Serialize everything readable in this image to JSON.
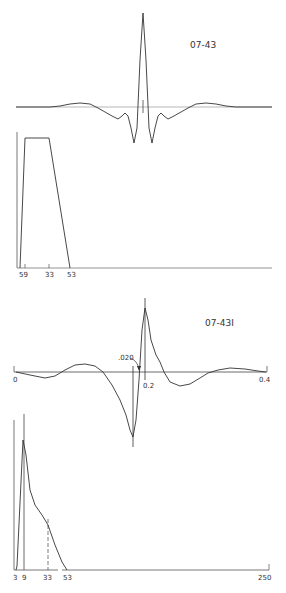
{
  "chart_data": [
    {
      "type": "line",
      "title": "07-43",
      "description": "Zero-phase wavelet (time domain)",
      "xlabel": "",
      "ylabel": "",
      "grid": false,
      "points": [
        [
          16,
          107
        ],
        [
          50,
          107
        ],
        [
          60,
          106
        ],
        [
          70,
          104
        ],
        [
          80,
          103
        ],
        [
          90,
          104
        ],
        [
          98,
          108
        ],
        [
          105,
          112
        ],
        [
          112,
          116
        ],
        [
          118,
          119
        ],
        [
          122,
          116
        ],
        [
          125,
          113
        ],
        [
          128,
          116
        ],
        [
          131,
          128
        ],
        [
          134,
          143
        ],
        [
          137,
          128
        ],
        [
          140,
          60
        ],
        [
          143,
          13
        ],
        [
          146,
          60
        ],
        [
          149,
          128
        ],
        [
          152,
          143
        ],
        [
          155,
          128
        ],
        [
          158,
          116
        ],
        [
          161,
          113
        ],
        [
          164,
          116
        ],
        [
          168,
          119
        ],
        [
          174,
          116
        ],
        [
          181,
          112
        ],
        [
          188,
          108
        ],
        [
          196,
          104
        ],
        [
          206,
          103
        ],
        [
          216,
          104
        ],
        [
          226,
          106
        ],
        [
          236,
          107
        ],
        [
          272,
          107
        ]
      ]
    },
    {
      "type": "line",
      "title": "",
      "description": "Amplitude spectrum for 07-43 (trapezoid)",
      "xtick_labels": [
        "59",
        "33",
        "53"
      ],
      "points": [
        [
          20,
          268
        ],
        [
          25,
          138
        ],
        [
          49,
          138
        ],
        [
          70,
          268
        ]
      ]
    },
    {
      "type": "line",
      "title": "07-43I",
      "description": "Minimum/mixed-phase wavelet (time domain)",
      "xtick_labels": [
        "0",
        "0.2",
        "0.4"
      ],
      "annotations": [
        ".020"
      ],
      "points": [
        [
          16,
          372
        ],
        [
          30,
          375
        ],
        [
          45,
          378
        ],
        [
          55,
          376
        ],
        [
          65,
          370
        ],
        [
          75,
          365
        ],
        [
          85,
          364
        ],
        [
          95,
          366
        ],
        [
          103,
          372
        ],
        [
          112,
          385
        ],
        [
          120,
          400
        ],
        [
          126,
          415
        ],
        [
          130,
          430
        ],
        [
          133,
          437
        ],
        [
          136,
          420
        ],
        [
          139,
          380
        ],
        [
          142,
          330
        ],
        [
          145,
          308
        ],
        [
          148,
          320
        ],
        [
          151,
          340
        ],
        [
          156,
          355
        ],
        [
          160,
          362
        ],
        [
          164,
          372
        ],
        [
          170,
          382
        ],
        [
          180,
          386
        ],
        [
          190,
          384
        ],
        [
          200,
          378
        ],
        [
          208,
          373
        ],
        [
          218,
          370
        ],
        [
          230,
          368
        ],
        [
          245,
          369
        ],
        [
          258,
          371
        ],
        [
          266,
          372
        ]
      ]
    },
    {
      "type": "line",
      "title": "",
      "description": "Amplitude spectrum for 07-43I",
      "xtick_labels": [
        "3",
        "9",
        "33",
        "53",
        "250"
      ],
      "points": [
        [
          16,
          570
        ],
        [
          17,
          566
        ],
        [
          23,
          440
        ],
        [
          26,
          455
        ],
        [
          30,
          490
        ],
        [
          35,
          505
        ],
        [
          42,
          515
        ],
        [
          48,
          525
        ],
        [
          55,
          545
        ],
        [
          62,
          562
        ],
        [
          67,
          570
        ]
      ]
    }
  ],
  "labels": {
    "plot1_title": "07-43",
    "plot2_ticks": [
      "59",
      "33",
      "53"
    ],
    "plot3_title": "07-43I",
    "plot3_ticks": [
      "0",
      "0.2",
      "0.4"
    ],
    "plot3_annotation": ".020",
    "plot4_ticks": [
      "3",
      "9",
      "33",
      "53",
      "250"
    ]
  }
}
